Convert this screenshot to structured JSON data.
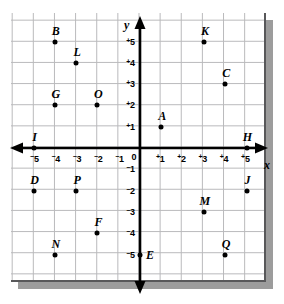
{
  "figure": {
    "type": "coordinate-plane",
    "x_axis_label": "x",
    "y_axis_label": "y",
    "x_ticks": [
      {
        "sign": "-",
        "digit": "5",
        "value": -5
      },
      {
        "sign": "-",
        "digit": "4",
        "value": -4
      },
      {
        "sign": "-",
        "digit": "3",
        "value": -3
      },
      {
        "sign": "-",
        "digit": "2",
        "value": -2
      },
      {
        "sign": "-",
        "digit": "1",
        "value": -1
      },
      {
        "sign": "",
        "digit": "0",
        "value": 0
      },
      {
        "sign": "+",
        "digit": "1",
        "value": 1
      },
      {
        "sign": "+",
        "digit": "2",
        "value": 2
      },
      {
        "sign": "+",
        "digit": "3",
        "value": 3
      },
      {
        "sign": "+",
        "digit": "4",
        "value": 4
      },
      {
        "sign": "+",
        "digit": "5",
        "value": 5
      }
    ],
    "y_ticks": [
      {
        "sign": "+",
        "digit": "5",
        "value": 5
      },
      {
        "sign": "+",
        "digit": "4",
        "value": 4
      },
      {
        "sign": "+",
        "digit": "3",
        "value": 3
      },
      {
        "sign": "+",
        "digit": "2",
        "value": 2
      },
      {
        "sign": "+",
        "digit": "1",
        "value": 1
      },
      {
        "sign": "",
        "digit": "0",
        "value": 0
      },
      {
        "sign": "-",
        "digit": "1",
        "value": -1
      },
      {
        "sign": "-",
        "digit": "2",
        "value": -2
      },
      {
        "sign": "-",
        "digit": "3",
        "value": -3
      },
      {
        "sign": "-",
        "digit": "4",
        "value": -4
      },
      {
        "sign": "-",
        "digit": "5",
        "value": -5
      }
    ],
    "colors": {
      "axis": "#000000",
      "grid": "#b9b9bb",
      "point": "#000000",
      "border": "#58585a",
      "shadow": "#9c9c9c",
      "background": "#ffffff"
    },
    "points": [
      {
        "label": "A",
        "x": 1,
        "y": 1,
        "label_pos": "above"
      },
      {
        "label": "B",
        "x": -4,
        "y": 5,
        "label_pos": "above"
      },
      {
        "label": "C",
        "x": 4,
        "y": 3,
        "label_pos": "above"
      },
      {
        "label": "D",
        "x": -5,
        "y": -2,
        "label_pos": "above"
      },
      {
        "label": "E",
        "x": 0,
        "y": -5,
        "label_pos": "right"
      },
      {
        "label": "F",
        "x": -2,
        "y": -4,
        "label_pos": "above"
      },
      {
        "label": "G",
        "x": -4,
        "y": 2,
        "label_pos": "above"
      },
      {
        "label": "H",
        "x": 5,
        "y": 0,
        "label_pos": "above"
      },
      {
        "label": "I",
        "x": -5,
        "y": 0,
        "label_pos": "above"
      },
      {
        "label": "J",
        "x": 5,
        "y": -2,
        "label_pos": "above"
      },
      {
        "label": "K",
        "x": 3,
        "y": 5,
        "label_pos": "above"
      },
      {
        "label": "L",
        "x": -3,
        "y": 4,
        "label_pos": "above"
      },
      {
        "label": "M",
        "x": 3,
        "y": -3,
        "label_pos": "above"
      },
      {
        "label": "N",
        "x": -4,
        "y": -5,
        "label_pos": "above"
      },
      {
        "label": "O",
        "x": -2,
        "y": 2,
        "label_pos": "above"
      },
      {
        "label": "P",
        "x": -3,
        "y": -2,
        "label_pos": "above"
      },
      {
        "label": "Q",
        "x": 4,
        "y": -5,
        "label_pos": "above"
      }
    ]
  }
}
